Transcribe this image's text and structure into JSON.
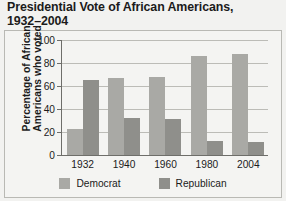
{
  "chart_data": {
    "type": "bar",
    "title": "Presidential Vote of African Americans,\n1932–2004",
    "xlabel": "",
    "ylabel": "Percentage of African\nAmericans who voted",
    "categories": [
      "1932",
      "1940",
      "1960",
      "1980",
      "2004"
    ],
    "series": [
      {
        "name": "Democrat",
        "color": "#a9a9a5",
        "values": [
          23,
          67,
          68,
          86,
          88
        ]
      },
      {
        "name": "Republican",
        "color": "#8f8f8b",
        "values": [
          65,
          32,
          31,
          12,
          11
        ]
      }
    ],
    "ylim": [
      0,
      100
    ],
    "yticks": [
      0,
      20,
      40,
      60,
      80,
      100
    ],
    "ytick_labels": [
      "0",
      "20",
      "40",
      "60",
      "80",
      "100"
    ],
    "grid": true,
    "legend_position": "bottom"
  },
  "legend": {
    "items": [
      {
        "label": "Democrat",
        "color": "#a9a9a5"
      },
      {
        "label": "Republican",
        "color": "#8f8f8b"
      }
    ]
  }
}
